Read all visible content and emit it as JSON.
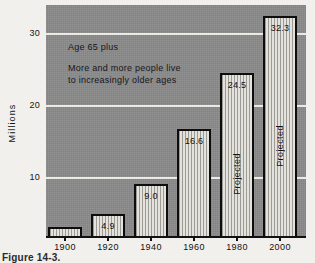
{
  "chart_data": {
    "type": "bar",
    "title": "",
    "categories": [
      "1900",
      "1920",
      "1940",
      "1960",
      "1980",
      "2000"
    ],
    "values": [
      3.1,
      4.9,
      9.0,
      16.6,
      24.5,
      32.3
    ],
    "value_labels": [
      "3.1",
      "4.9",
      "9.0",
      "16.6",
      "24.5",
      "32.3"
    ],
    "bar_notes": [
      "",
      "",
      "",
      "",
      "Projected",
      "Projected"
    ],
    "xlabel": "",
    "ylabel": "Millions",
    "ylim": [
      0,
      34
    ],
    "yticks": [
      10,
      20,
      30
    ],
    "ytick_labels": [
      "10",
      "20",
      "30"
    ],
    "grid": true,
    "legend": "none",
    "annotations": [
      "Age 65 plus",
      "More and more people live",
      "to increasingly older ages"
    ]
  },
  "axis": {
    "y_label": "Millions",
    "y_ticks": [
      {
        "label": "30",
        "value": 30
      },
      {
        "label": "20",
        "value": 20
      },
      {
        "label": "10",
        "value": 10
      }
    ],
    "x_ticks": [
      {
        "label": "1900"
      },
      {
        "label": "1920"
      },
      {
        "label": "1940"
      },
      {
        "label": "1960"
      },
      {
        "label": "1980"
      },
      {
        "label": "2000"
      }
    ]
  },
  "bars": [
    {
      "category": "1900",
      "value": 3.1,
      "label": "3.1",
      "note": ""
    },
    {
      "category": "1920",
      "value": 4.9,
      "label": "4.9",
      "note": ""
    },
    {
      "category": "1940",
      "value": 9.0,
      "label": "9.0",
      "note": ""
    },
    {
      "category": "1960",
      "value": 16.6,
      "label": "16.6",
      "note": ""
    },
    {
      "category": "1980",
      "value": 24.5,
      "label": "24.5",
      "note": "Projected"
    },
    {
      "category": "2000",
      "value": 32.3,
      "label": "32.3",
      "note": "Projected"
    }
  ],
  "annotation": {
    "line1": "Age 65 plus",
    "line2": "More and more people live",
    "line3": "to increasingly older ages"
  },
  "caption": {
    "text": "Figure  14-3."
  },
  "colors": {
    "plot_background": "#8b8b8b",
    "gridline": "#eceae4",
    "bar_outline": "#0d0d0d",
    "bar_fill_light": "#e4e2dd",
    "bar_fill_stripe": "#9c9a95",
    "page_background": "#f2f0ec",
    "text": "#121212"
  }
}
